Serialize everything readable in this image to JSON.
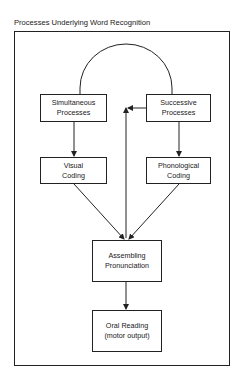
{
  "title": "Processes Underlying Word Recognition",
  "nodes": {
    "simultaneous": {
      "line1": "Simultaneous",
      "line2": "Processes"
    },
    "successive": {
      "line1": "Successive",
      "line2": "Processes"
    },
    "visual": {
      "line1": "Visual",
      "line2": "Coding"
    },
    "phonological": {
      "line1": "Phonological",
      "line2": "Coding"
    },
    "assembling": {
      "line1": "Assembling",
      "line2": "Pronunciation"
    },
    "oral": {
      "line1": "Oral Reading",
      "line2": "(motor output)"
    }
  },
  "edges": [
    {
      "from": "simultaneous",
      "to": "successive",
      "type": "arc (no arrow)"
    },
    {
      "from": "simultaneous",
      "to": "visual",
      "type": "arrow"
    },
    {
      "from": "successive",
      "to": "phonological",
      "type": "arrow"
    },
    {
      "from": "successive",
      "to": "assembling",
      "type": "arrow (bidirectional vertical line)"
    },
    {
      "from": "visual",
      "to": "assembling",
      "type": "arrow"
    },
    {
      "from": "phonological",
      "to": "assembling",
      "type": "arrow"
    },
    {
      "from": "assembling",
      "to": "oral",
      "type": "arrow"
    }
  ]
}
